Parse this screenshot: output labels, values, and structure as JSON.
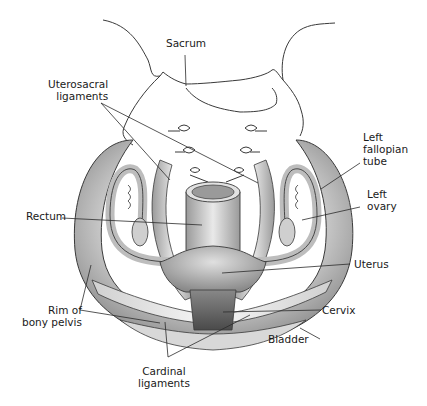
{
  "diagram": {
    "labels": {
      "sacrum": "Sacrum",
      "uterosacral": "Uterosacral\nligaments",
      "left_fallopian_tube": "Left\nfallopian\ntube",
      "left_ovary": "Left\novary",
      "rectum": "Rectum",
      "uterus": "Uterus",
      "rim_bony_pelvis": "Rim of\nbony pelvis",
      "cervix": "Cervix",
      "bladder": "Bladder",
      "cardinal": "Cardinal\nligaments"
    },
    "colors": {
      "outline": "#3a3a3a",
      "tissue_light": "#e6e6e6",
      "tissue_mid": "#bdbdbd",
      "tissue_dark": "#6e6e6e",
      "leader": "#2b2b2b"
    }
  }
}
